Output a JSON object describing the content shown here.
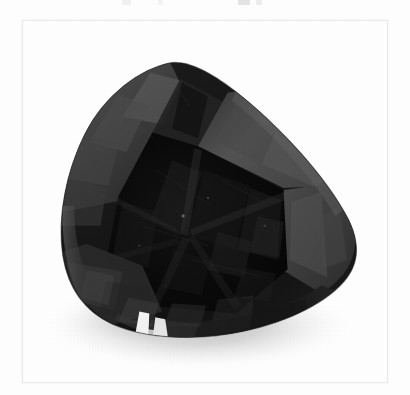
{
  "page": {
    "background_color": "#fdfdfd",
    "width": 410,
    "height": 395,
    "top_crop_artifact_label": "cropped-text-remnant"
  },
  "photo_card": {
    "background_color": "#ffffff",
    "border_color": "#eaeaea",
    "left": 22,
    "top": 20,
    "width": 366,
    "height": 363
  },
  "photo": {
    "subject": "faceted black gemstone",
    "cut": "pear / drop brilliant cut",
    "orientation": "apex up, tilted right",
    "background_color": "#ffffff",
    "alt_text": "Photograph of a dark faceted pear-cut gemstone on a white background",
    "colors": {
      "stone_darkest": "#080808",
      "stone_body": "#161616",
      "stone_mid": "#2a2a2a",
      "crown_facet_light": "#4d4d4d",
      "crown_facet_lighter": "#5a5a5a",
      "girdle_edge": "#3c3c3c",
      "highlight_white": "#fbfbfb",
      "shadow_gray": "#c9c9c9",
      "shadow_gray_soft": "#e0e0e0"
    },
    "features": [
      {
        "name": "upper-left-crown-facets",
        "tone": "#4a4a4a"
      },
      {
        "name": "apex-kite-facet",
        "tone": "#1b1b1b"
      },
      {
        "name": "table-facet",
        "tone": "#0c0c0c"
      },
      {
        "name": "right-shoulder-facets",
        "tone": "#565656"
      },
      {
        "name": "lower-girdle-band",
        "tone": "#343434"
      },
      {
        "name": "bottom-light-leak-highlight",
        "tone": "#fbfbfb"
      },
      {
        "name": "cast-shadow",
        "tone": "#cfcfcf"
      }
    ],
    "silhouette_bounds": {
      "left": 36,
      "top": 42,
      "right": 336,
      "bottom": 317
    }
  }
}
